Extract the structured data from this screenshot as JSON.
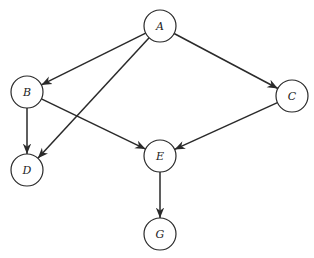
{
  "diagram": {
    "type": "directed-graph",
    "nodes": [
      {
        "id": "A",
        "label": "A",
        "x": 160,
        "y": 26
      },
      {
        "id": "B",
        "label": "B",
        "x": 27,
        "y": 92
      },
      {
        "id": "C",
        "label": "C",
        "x": 292,
        "y": 96
      },
      {
        "id": "D",
        "label": "D",
        "x": 27,
        "y": 170
      },
      {
        "id": "E",
        "label": "E",
        "x": 160,
        "y": 156
      },
      {
        "id": "G",
        "label": "G",
        "x": 160,
        "y": 234
      }
    ],
    "edges": [
      {
        "from": "A",
        "to": "B"
      },
      {
        "from": "A",
        "to": "C"
      },
      {
        "from": "A",
        "to": "D"
      },
      {
        "from": "B",
        "to": "D"
      },
      {
        "from": "B",
        "to": "E"
      },
      {
        "from": "C",
        "to": "E"
      },
      {
        "from": "E",
        "to": "G"
      }
    ],
    "colors": {
      "stroke": "#2a2a2a",
      "fill": "#ffffff"
    }
  }
}
